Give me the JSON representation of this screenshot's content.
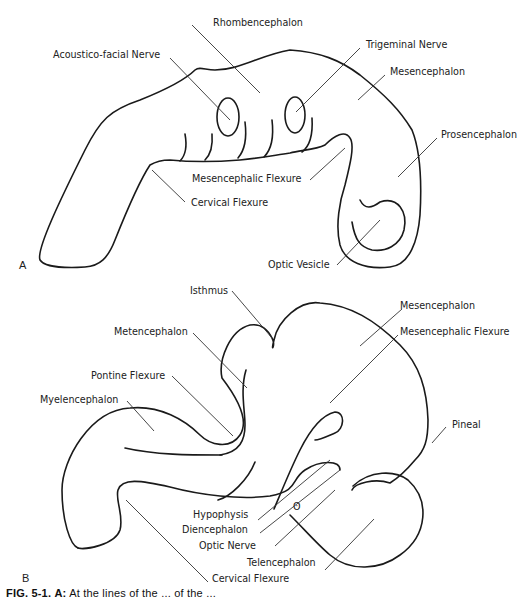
{
  "panel_a": {
    "letter": "A",
    "labels": {
      "rhombencephalon": "Rhombencephalon",
      "acoustico_facial_nerve": "Acoustico-facial Nerve",
      "trigeminal_nerve": "Trigeminal Nerve",
      "mesencephalon": "Mesencephalon",
      "prosencephalon": "Prosencephalon",
      "mesencephalic_flexure": "Mesencephalic Flexure",
      "cervical_flexure": "Cervical Flexure",
      "optic_vesicle": "Optic Vesicle"
    }
  },
  "panel_b": {
    "letter": "B",
    "labels": {
      "isthmus": "Isthmus",
      "mesencephalon": "Mesencephalon",
      "mesencephalic_flexure": "Mesencephalic Flexure",
      "metencephalon": "Metencephalon",
      "pontine_flexure": "Pontine Flexure",
      "myelencephalon": "Myelencephalon",
      "pineal": "Pineal",
      "hypophysis": "Hypophysis",
      "diencephalon": "Diencephalon",
      "optic_nerve": "Optic Nerve",
      "telencephalon": "Telencephalon",
      "cervical_flexure": "Cervical Flexure"
    }
  },
  "caption": {
    "fig": "FIG. 5-1.",
    "part": "A:",
    "text": "At the lines of the ... of the ..."
  }
}
